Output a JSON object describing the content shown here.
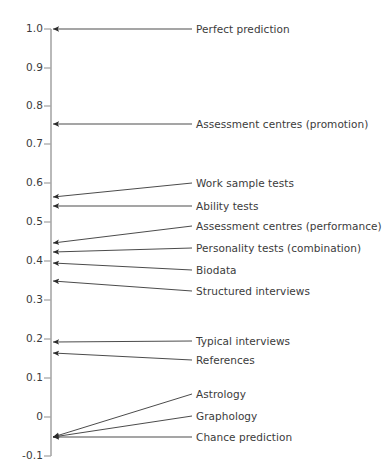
{
  "chart_data": {
    "type": "scatter",
    "title": "",
    "subtitle": "",
    "xlabel": "",
    "ylabel": "",
    "orientation": "vertical-axis-with-annotation-arrows",
    "grid": false,
    "legend": false,
    "axis": {
      "ylim": [
        -0.1,
        1.0
      ],
      "ticks": [
        {
          "value": 1.0,
          "label": "1.0",
          "y": 29
        },
        {
          "value": 0.9,
          "label": "0.9",
          "y": 68
        },
        {
          "value": 0.8,
          "label": "0.8",
          "y": 106
        },
        {
          "value": 0.7,
          "label": "0.7",
          "y": 144
        },
        {
          "value": 0.6,
          "label": "0.6",
          "y": 183
        },
        {
          "value": 0.5,
          "label": "0.5",
          "y": 222
        },
        {
          "value": 0.4,
          "label": "0.4",
          "y": 261
        },
        {
          "value": 0.3,
          "label": "0.3",
          "y": 300
        },
        {
          "value": 0.2,
          "label": "0.2",
          "y": 339
        },
        {
          "value": 0.1,
          "label": "0.1",
          "y": 378
        },
        {
          "value": 0.0,
          "label": "0",
          "y": 417
        },
        {
          "value": -0.1,
          "label": "-0.1",
          "y": 456
        }
      ]
    },
    "categories": [
      "Perfect prediction",
      "Assessment centres (promotion)",
      "Work sample tests",
      "Ability tests",
      "Assessment centres (performance)",
      "Personality tests (combination)",
      "Biodata",
      "Structured interviews",
      "Typical interviews",
      "References",
      "Astrology",
      "Graphology",
      "Chance prediction"
    ],
    "values": [
      1.0,
      0.75,
      0.55,
      0.53,
      0.43,
      0.41,
      0.39,
      0.35,
      0.18,
      0.15,
      0.0,
      0.0,
      0.0
    ],
    "points": [
      {
        "label": "Perfect prediction",
        "value": 1.0,
        "arrow_tip_y": 29,
        "label_y": 29
      },
      {
        "label": "Assessment centres (promotion)",
        "value": 0.75,
        "arrow_tip_y": 124,
        "label_y": 124
      },
      {
        "label": "Work sample tests",
        "value": 0.55,
        "arrow_tip_y": 197,
        "label_y": 183
      },
      {
        "label": "Ability tests",
        "value": 0.53,
        "arrow_tip_y": 206,
        "label_y": 206
      },
      {
        "label": "Assessment centres (performance)",
        "value": 0.43,
        "arrow_tip_y": 243,
        "label_y": 226
      },
      {
        "label": "Personality tests (combination)",
        "value": 0.41,
        "arrow_tip_y": 252,
        "label_y": 248
      },
      {
        "label": "Biodata",
        "value": 0.39,
        "arrow_tip_y": 263,
        "label_y": 270
      },
      {
        "label": "Structured interviews",
        "value": 0.35,
        "arrow_tip_y": 281,
        "label_y": 291
      },
      {
        "label": "Typical interviews",
        "value": 0.18,
        "arrow_tip_y": 342,
        "label_y": 341
      },
      {
        "label": "References",
        "value": 0.15,
        "arrow_tip_y": 353,
        "label_y": 360
      },
      {
        "label": "Astrology",
        "value": 0.0,
        "arrow_tip_y": 437,
        "label_y": 394
      },
      {
        "label": "Graphology",
        "value": 0.0,
        "arrow_tip_y": 437,
        "label_y": 416
      },
      {
        "label": "Chance prediction",
        "value": 0.0,
        "arrow_tip_y": 437,
        "label_y": 437
      }
    ],
    "colors": {
      "axis": "#a8a8a8",
      "arrow": "#2b2b2b",
      "text": "#3b3b3b",
      "background": "#ffffff"
    }
  }
}
